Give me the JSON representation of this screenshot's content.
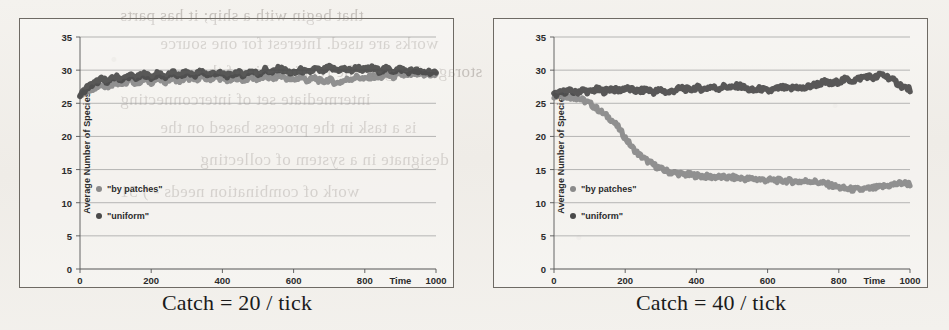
{
  "figure": {
    "panels": [
      {
        "id": "left",
        "caption": "Catch = 20 / tick",
        "chart_data": {
          "type": "line",
          "title": "",
          "xlabel": "Time",
          "ylabel": "Average Number of Species",
          "xlim": [
            0,
            1000
          ],
          "ylim": [
            0,
            35
          ],
          "xticks": [
            0,
            200,
            400,
            600,
            800,
            1000
          ],
          "yticks": [
            0,
            5,
            10,
            15,
            20,
            25,
            30,
            35
          ],
          "grid": "horizontal",
          "legend_position": "inner-left",
          "series": [
            {
              "name": "\"by patches\"",
              "color": "#8a8a8a",
              "x": [
                0,
                20,
                40,
                60,
                80,
                100,
                120,
                140,
                160,
                180,
                200,
                220,
                240,
                260,
                280,
                300,
                320,
                340,
                360,
                380,
                400,
                420,
                440,
                460,
                480,
                500,
                520,
                540,
                560,
                580,
                600,
                620,
                640,
                660,
                680,
                700,
                720,
                740,
                760,
                780,
                800,
                820,
                840,
                860,
                880,
                900,
                920,
                940,
                960,
                980,
                1000
              ],
              "values": [
                26.0,
                26.9,
                27.4,
                27.8,
                27.6,
                28.2,
                27.9,
                28.4,
                28.1,
                28.6,
                28.2,
                28.7,
                28.3,
                28.8,
                28.4,
                28.9,
                28.5,
                29.0,
                28.6,
                29.0,
                28.7,
                28.4,
                28.9,
                28.5,
                29.0,
                28.6,
                29.1,
                28.7,
                29.2,
                28.8,
                28.5,
                29.0,
                28.4,
                28.8,
                28.2,
                28.6,
                28.0,
                28.4,
                28.7,
                29.0,
                28.6,
                29.1,
                28.8,
                29.3,
                29.0,
                29.4,
                29.1,
                29.5,
                29.2,
                29.4,
                29.2
              ]
            },
            {
              "name": "\"uniform\"",
              "color": "#4a4a4a",
              "x": [
                0,
                20,
                40,
                60,
                80,
                100,
                120,
                140,
                160,
                180,
                200,
                220,
                240,
                260,
                280,
                300,
                320,
                340,
                360,
                380,
                400,
                420,
                440,
                460,
                480,
                500,
                520,
                540,
                560,
                580,
                600,
                620,
                640,
                660,
                680,
                700,
                720,
                740,
                760,
                780,
                800,
                820,
                840,
                860,
                880,
                900,
                920,
                940,
                960,
                980,
                1000
              ],
              "values": [
                26.2,
                27.4,
                28.0,
                28.6,
                28.3,
                29.0,
                28.6,
                29.2,
                28.8,
                29.4,
                28.9,
                29.5,
                29.0,
                29.6,
                29.1,
                29.7,
                29.2,
                29.8,
                29.3,
                29.6,
                29.4,
                29.1,
                29.7,
                29.3,
                29.9,
                29.4,
                30.1,
                29.6,
                30.3,
                29.8,
                29.5,
                30.0,
                29.6,
                30.2,
                29.8,
                30.4,
                30.0,
                30.2,
                29.9,
                30.4,
                30.0,
                30.3,
                29.9,
                30.2,
                29.9,
                30.2,
                29.8,
                30.0,
                29.6,
                29.8,
                29.4
              ]
            }
          ]
        }
      },
      {
        "id": "right",
        "caption": "Catch = 40 / tick",
        "chart_data": {
          "type": "line",
          "title": "",
          "xlabel": "Time",
          "ylabel": "Average Number of Species",
          "xlim": [
            0,
            1000
          ],
          "ylim": [
            0,
            35
          ],
          "xticks": [
            0,
            200,
            400,
            600,
            800,
            1000
          ],
          "yticks": [
            0,
            5,
            10,
            15,
            20,
            25,
            30,
            35
          ],
          "grid": "horizontal",
          "legend_position": "inner-left",
          "series": [
            {
              "name": "\"by patches\"",
              "color": "#8a8a8a",
              "x": [
                0,
                20,
                40,
                60,
                80,
                100,
                120,
                140,
                160,
                180,
                200,
                220,
                240,
                260,
                280,
                300,
                320,
                340,
                360,
                380,
                400,
                420,
                440,
                460,
                480,
                500,
                520,
                540,
                560,
                580,
                600,
                620,
                640,
                660,
                680,
                700,
                720,
                740,
                760,
                780,
                800,
                820,
                840,
                860,
                880,
                900,
                920,
                940,
                960,
                980,
                1000
              ],
              "values": [
                26.1,
                26.2,
                26.0,
                25.9,
                25.5,
                25.0,
                24.2,
                23.4,
                22.6,
                21.4,
                19.8,
                18.3,
                17.2,
                16.4,
                15.7,
                15.1,
                14.7,
                14.5,
                14.3,
                14.2,
                14.1,
                14.0,
                13.9,
                13.9,
                13.8,
                13.8,
                13.7,
                13.6,
                13.6,
                13.5,
                13.4,
                13.4,
                13.3,
                13.3,
                13.2,
                13.2,
                13.3,
                13.1,
                12.9,
                12.6,
                12.3,
                12.1,
                12.0,
                12.0,
                12.1,
                12.2,
                12.4,
                12.6,
                12.8,
                13.0,
                12.8
              ]
            },
            {
              "name": "\"uniform\"",
              "color": "#4a4a4a",
              "x": [
                0,
                20,
                40,
                60,
                80,
                100,
                120,
                140,
                160,
                180,
                200,
                220,
                240,
                260,
                280,
                300,
                320,
                340,
                360,
                380,
                400,
                420,
                440,
                460,
                480,
                500,
                520,
                540,
                560,
                580,
                600,
                620,
                640,
                660,
                680,
                700,
                720,
                740,
                760,
                780,
                800,
                820,
                840,
                860,
                880,
                900,
                920,
                940,
                960,
                980,
                1000
              ],
              "values": [
                26.3,
                26.6,
                26.9,
                26.6,
                27.0,
                26.7,
                27.1,
                26.8,
                27.2,
                26.9,
                27.3,
                27.0,
                26.8,
                27.1,
                26.7,
                27.0,
                26.6,
                27.0,
                27.3,
                27.0,
                27.4,
                27.1,
                27.5,
                27.2,
                27.6,
                27.3,
                27.7,
                27.2,
                26.9,
                27.2,
                26.8,
                27.1,
                27.4,
                27.1,
                27.5,
                27.2,
                27.6,
                27.9,
                28.2,
                27.9,
                28.3,
                28.6,
                28.4,
                28.8,
                29.1,
                28.8,
                29.4,
                28.9,
                28.2,
                27.5,
                27.1
              ]
            }
          ]
        }
      }
    ]
  },
  "scan_artifacts": {
    "bleed_lines": [
      "that begin with a ship; it has parts",
      "works are used. Interest for one source",
      "storage. Imagine the relationship of the",
      "intermediate set of interconnecting",
      "is a task in the process based on the",
      "designate in a system of collecting",
      "work of combination needs - ) 51"
    ]
  }
}
